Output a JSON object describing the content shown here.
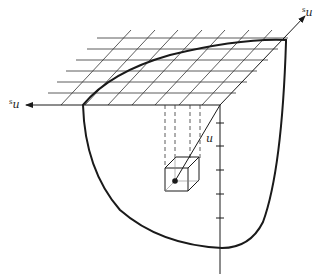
{
  "figure": {
    "labels": {
      "left_axis": {
        "prefix": "s",
        "main": "u"
      },
      "right_axis": {
        "prefix": "s",
        "main": "u"
      },
      "radial": "u"
    },
    "colors": {
      "stroke": "#1a1a1a",
      "grid": "#333333",
      "background": "#ffffff"
    },
    "vertical_axis_ticks": 5
  }
}
